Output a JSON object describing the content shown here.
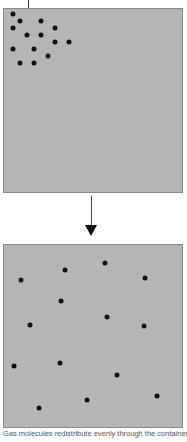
{
  "diagram": {
    "colors": {
      "box_fill": "#b5b5b5",
      "box_border": "#8a8a8a",
      "molecule": "#111111",
      "arrow": "#111111"
    },
    "top_box": {
      "label": "Initial state: molecules clustered in upper-left corner",
      "x": 3,
      "y": 8,
      "width": 180,
      "height": 185,
      "leader_line": {
        "x": 28,
        "y1": 0,
        "y2": 25
      },
      "molecules": [
        [
          13,
          14
        ],
        [
          20,
          21
        ],
        [
          41,
          21
        ],
        [
          13,
          28
        ],
        [
          55,
          28
        ],
        [
          27,
          35
        ],
        [
          41,
          35
        ],
        [
          55,
          42
        ],
        [
          69,
          42
        ],
        [
          13,
          49
        ],
        [
          34,
          49
        ],
        [
          48,
          56
        ],
        [
          20,
          63
        ],
        [
          34,
          63
        ]
      ]
    },
    "arrow": {
      "x": 91,
      "y1": 196,
      "y2": 236,
      "direction": "down"
    },
    "bottom_box": {
      "label": "Final state: molecules evenly distributed",
      "x": 3,
      "y": 244,
      "width": 180,
      "height": 184,
      "molecules": [
        [
          21,
          280
        ],
        [
          65,
          270
        ],
        [
          105,
          263
        ],
        [
          145,
          278
        ],
        [
          61,
          301
        ],
        [
          107,
          317
        ],
        [
          30,
          325
        ],
        [
          144,
          326
        ],
        [
          14,
          366
        ],
        [
          60,
          363
        ],
        [
          117,
          375
        ],
        [
          157,
          396
        ],
        [
          87,
          400
        ],
        [
          39,
          408
        ]
      ]
    },
    "caption": "Gas molecules redistribute evenly through the container,"
  }
}
